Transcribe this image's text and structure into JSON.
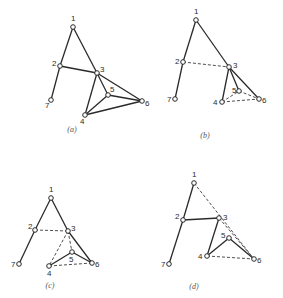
{
  "figure": {
    "panels": [
      {
        "id": "a",
        "caption": "(a)",
        "caption_pos": [
          72,
          132
        ],
        "nodes": [
          {
            "id": "1",
            "x": 73,
            "y": 27,
            "lx": 71,
            "ly": 21
          },
          {
            "id": "2",
            "x": 60,
            "y": 66,
            "lx": 52,
            "ly": 66
          },
          {
            "id": "3",
            "x": 97,
            "y": 73,
            "lx": 100,
            "ly": 72
          },
          {
            "id": "4",
            "x": 85,
            "y": 115,
            "lx": 80,
            "ly": 124
          },
          {
            "id": "5",
            "x": 108,
            "y": 95,
            "lx": 110,
            "ly": 92
          },
          {
            "id": "6",
            "x": 142,
            "y": 101,
            "lx": 145,
            "ly": 106
          },
          {
            "id": "7",
            "x": 51,
            "y": 100,
            "lx": 45,
            "ly": 108
          }
        ],
        "edges": [
          {
            "from": "1",
            "to": "2",
            "style": "solid"
          },
          {
            "from": "1",
            "to": "3",
            "style": "solid"
          },
          {
            "from": "3",
            "to": "5",
            "style": "solid"
          },
          {
            "from": "2",
            "to": "3",
            "style": "solid"
          },
          {
            "from": "2",
            "to": "7",
            "style": "solid"
          },
          {
            "from": "3",
            "to": "4",
            "style": "solid"
          },
          {
            "from": "3",
            "to": "6",
            "style": "solid"
          },
          {
            "from": "4",
            "to": "5",
            "style": "solid"
          },
          {
            "from": "5",
            "to": "6",
            "style": "solid"
          },
          {
            "from": "4",
            "to": "6",
            "style": "solid"
          }
        ]
      },
      {
        "id": "b",
        "caption": "(b)",
        "caption_pos": [
          205,
          138
        ],
        "nodes": [
          {
            "id": "1",
            "x": 196,
            "y": 20,
            "lx": 194,
            "ly": 14
          },
          {
            "id": "2",
            "x": 183,
            "y": 62,
            "lx": 175,
            "ly": 64
          },
          {
            "id": "3",
            "x": 229,
            "y": 67,
            "lx": 233,
            "ly": 68
          },
          {
            "id": "4",
            "x": 222,
            "y": 102,
            "lx": 213,
            "ly": 105
          },
          {
            "id": "5",
            "x": 239,
            "y": 91,
            "lx": 232,
            "ly": 93
          },
          {
            "id": "6",
            "x": 259,
            "y": 99,
            "lx": 262,
            "ly": 103
          },
          {
            "id": "7",
            "x": 175,
            "y": 99,
            "lx": 167,
            "ly": 102
          }
        ],
        "edges": [
          {
            "from": "1",
            "to": "2",
            "style": "solid"
          },
          {
            "from": "1",
            "to": "3",
            "style": "solid"
          },
          {
            "from": "2",
            "to": "7",
            "style": "solid"
          },
          {
            "from": "2",
            "to": "3",
            "style": "dashed"
          },
          {
            "from": "3",
            "to": "4",
            "style": "solid"
          },
          {
            "from": "3",
            "to": "5",
            "style": "solid"
          },
          {
            "from": "3",
            "to": "6",
            "style": "solid"
          },
          {
            "from": "4",
            "to": "5",
            "style": "dashed"
          },
          {
            "from": "5",
            "to": "6",
            "style": "dashed"
          },
          {
            "from": "4",
            "to": "6",
            "style": "dashed"
          }
        ]
      },
      {
        "id": "c",
        "caption": "(c)",
        "caption_pos": [
          50,
          288
        ],
        "nodes": [
          {
            "id": "1",
            "x": 51,
            "y": 198,
            "lx": 49,
            "ly": 192
          },
          {
            "id": "2",
            "x": 35,
            "y": 230,
            "lx": 28,
            "ly": 229
          },
          {
            "id": "3",
            "x": 68,
            "y": 231,
            "lx": 71,
            "ly": 231
          },
          {
            "id": "4",
            "x": 49,
            "y": 266,
            "lx": 47,
            "ly": 276
          },
          {
            "id": "5",
            "x": 72,
            "y": 252,
            "lx": 69,
            "ly": 262
          },
          {
            "id": "6",
            "x": 92,
            "y": 263,
            "lx": 95,
            "ly": 267
          },
          {
            "id": "7",
            "x": 19,
            "y": 264,
            "lx": 11,
            "ly": 267
          }
        ],
        "edges": [
          {
            "from": "1",
            "to": "2",
            "style": "solid"
          },
          {
            "from": "1",
            "to": "3",
            "style": "solid"
          },
          {
            "from": "2",
            "to": "7",
            "style": "solid"
          },
          {
            "from": "2",
            "to": "3",
            "style": "dashed"
          },
          {
            "from": "3",
            "to": "4",
            "style": "dashed"
          },
          {
            "from": "3",
            "to": "5",
            "style": "dashed"
          },
          {
            "from": "3",
            "to": "6",
            "style": "solid"
          },
          {
            "from": "4",
            "to": "5",
            "style": "solid"
          },
          {
            "from": "5",
            "to": "6",
            "style": "solid"
          },
          {
            "from": "4",
            "to": "6",
            "style": "dashed"
          }
        ]
      },
      {
        "id": "d",
        "caption": "(d)",
        "caption_pos": [
          194,
          289
        ],
        "nodes": [
          {
            "id": "1",
            "x": 194,
            "y": 183,
            "lx": 192,
            "ly": 177
          },
          {
            "id": "2",
            "x": 183,
            "y": 220,
            "lx": 175,
            "ly": 219
          },
          {
            "id": "3",
            "x": 219,
            "y": 218,
            "lx": 223,
            "ly": 220
          },
          {
            "id": "4",
            "x": 207,
            "y": 256,
            "lx": 198,
            "ly": 259
          },
          {
            "id": "5",
            "x": 229,
            "y": 238,
            "lx": 221,
            "ly": 238
          },
          {
            "id": "6",
            "x": 254,
            "y": 259,
            "lx": 257,
            "ly": 263
          },
          {
            "id": "7",
            "x": 169,
            "y": 264,
            "lx": 161,
            "ly": 267
          }
        ],
        "edges": [
          {
            "from": "1",
            "to": "2",
            "style": "solid"
          },
          {
            "from": "2",
            "to": "7",
            "style": "solid"
          },
          {
            "from": "2",
            "to": "3",
            "style": "solid"
          },
          {
            "from": "3",
            "to": "4",
            "style": "solid"
          },
          {
            "from": "4",
            "to": "5",
            "style": "solid"
          },
          {
            "from": "5",
            "to": "6",
            "style": "solid"
          },
          {
            "from": "1",
            "to": "6",
            "style": "dashed"
          },
          {
            "from": "3",
            "to": "6",
            "style": "dashed"
          },
          {
            "from": "4",
            "to": "6",
            "style": "dashed"
          }
        ]
      }
    ]
  }
}
